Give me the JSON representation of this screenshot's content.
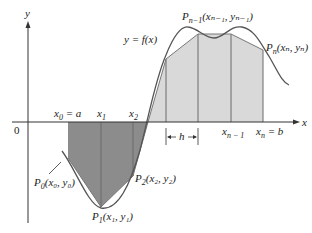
{
  "figure": {
    "curve_label": "y = f(x)",
    "axes": {
      "x_label": "x",
      "y_label": "y",
      "origin_label": "0"
    },
    "x_ticks": [
      {
        "name": "x0",
        "label": "x",
        "sub": "0",
        "suffix": " = a"
      },
      {
        "name": "x1",
        "label": "x",
        "sub": "1",
        "suffix": ""
      },
      {
        "name": "x2",
        "label": "x",
        "sub": "2",
        "suffix": ""
      },
      {
        "name": "xn-1",
        "label": "x",
        "sub": "n − 1",
        "suffix": ""
      },
      {
        "name": "xn",
        "label": "x",
        "sub": "n",
        "suffix": " = b"
      }
    ],
    "h_label": "h",
    "points": [
      {
        "name": "P0",
        "text": "P",
        "sub": "0",
        "coords": "(x₀, y₀)"
      },
      {
        "name": "P1",
        "text": "P",
        "sub": "1",
        "coords": "(x₁, y₁)"
      },
      {
        "name": "P2",
        "text": "P",
        "sub": "2",
        "coords": "(x₂, y₂)"
      },
      {
        "name": "Pn-1",
        "text": "P",
        "sub": "n−1",
        "coords": "(xₙ₋₁, yₙ₋₁)"
      },
      {
        "name": "Pn",
        "text": "P",
        "sub": "n",
        "coords": "(xₙ, yₙ)"
      }
    ],
    "colors": {
      "dark_fill": "#8c8c8c",
      "light_fill": "#d9d9d9",
      "curve": "#555555",
      "axis": "#333333"
    }
  }
}
